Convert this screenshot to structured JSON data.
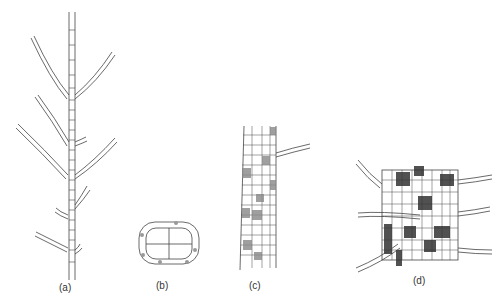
{
  "figure": {
    "panels": [
      {
        "id": "a",
        "label": "(a)",
        "description": "branched filament with uniseriate lateral branches"
      },
      {
        "id": "b",
        "label": "(b)",
        "description": "transverse section with four central cells and small cortical cells"
      },
      {
        "id": "c",
        "label": "(c)",
        "description": "corticated axis segment with stippled cells and a lateral filament"
      },
      {
        "id": "d",
        "label": "(d)",
        "description": "corticated axis with dark stippled cells and several lateral filaments"
      }
    ]
  }
}
